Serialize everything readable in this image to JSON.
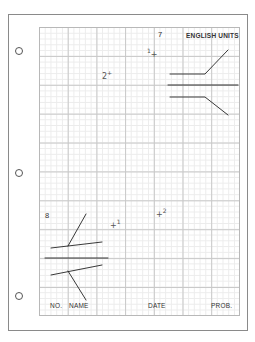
{
  "sheet": {
    "title": "ENGLISH UNITS",
    "problem_numbers": {
      "top": "7",
      "bottom": "8"
    },
    "footer": {
      "no_label": "NO.",
      "name_label": "NAME",
      "date_label": "DATE",
      "prob_label": "PROB."
    },
    "point_marks": {
      "top_1": "1",
      "top_2": "2",
      "bottom_1": "1",
      "bottom_2": "2",
      "plus": "+"
    },
    "grid": {
      "columns": 7,
      "rows": 10,
      "subdivisions": 5
    },
    "binder_holes": 3,
    "colors": {
      "line": "#222222",
      "grid_major": "#c8c8c8",
      "grid_minor": "#ececec",
      "border": "#8a8a8a"
    }
  }
}
